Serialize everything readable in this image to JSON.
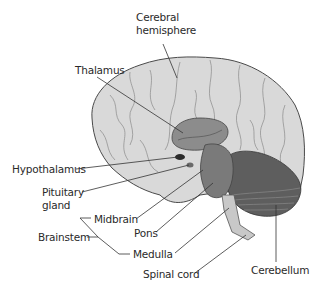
{
  "diagram": {
    "labels": {
      "cerebral_hemisphere_line1": "Cerebral",
      "cerebral_hemisphere_line2": "hemisphere",
      "thalamus": "Thalamus",
      "hypothalamus": "Hypothalamus",
      "pituitary_line1": "Pituitary",
      "pituitary_line2": "gland",
      "midbrain": "Midbrain",
      "brainstem": "Brainstem",
      "pons": "Pons",
      "medulla": "Medulla",
      "spinal_cord": "Spinal cord",
      "cerebellum": "Cerebellum"
    },
    "colors": {
      "cerebrum": "#d9d9d9",
      "thalamus": "#8c8c8c",
      "brainstem": "#7a7a7a",
      "cerebellum": "#5e5e5e",
      "hypothalamus": "#2a2a2a",
      "spinal_cord": "#c8c8c8",
      "outline": "#3a3a3a"
    }
  }
}
